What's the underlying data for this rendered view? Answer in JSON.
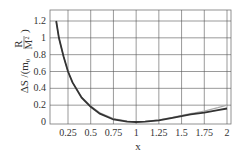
{
  "chart_data": {
    "type": "line",
    "title": "",
    "xlabel": "x",
    "ylabel": "ΔS /(m₀ R/M²)",
    "ylabel_parts": {
      "prefix": "ΔS /(m",
      "sub": "0",
      "frac_num": "R",
      "frac_den": "M",
      "sup": "2",
      "suffix": ")"
    },
    "xlim": [
      0.1,
      2.03
    ],
    "ylim": [
      -0.02,
      1.3
    ],
    "grid": true,
    "legend": null,
    "x_ticks": [
      0.25,
      0.5,
      0.75,
      1,
      1.25,
      1.5,
      1.75,
      2
    ],
    "x_tick_labels": [
      "0.25",
      "0.5",
      "0.75",
      "1",
      "1.25",
      "1.5",
      "1.75",
      "2"
    ],
    "y_ticks": [
      0,
      0.2,
      0.4,
      0.6,
      0.8,
      1,
      1.2
    ],
    "y_tick_labels": [
      "0",
      "0.2",
      "0.4",
      "0.6",
      "0.8",
      "1",
      "1.2"
    ],
    "x": [
      0.12,
      0.15,
      0.2,
      0.25,
      0.3,
      0.4,
      0.5,
      0.6,
      0.75,
      0.9,
      1.0,
      1.1,
      1.25,
      1.4,
      1.5,
      1.6,
      1.75,
      1.9,
      2.0
    ],
    "series": [
      {
        "name": "curve-dark",
        "color": "#333333",
        "values": [
          1.2,
          1.0,
          0.78,
          0.6,
          0.47,
          0.29,
          0.18,
          0.1,
          0.03,
          0.005,
          0.0,
          0.005,
          0.02,
          0.05,
          0.07,
          0.09,
          0.11,
          0.14,
          0.16
        ]
      },
      {
        "name": "curve-light",
        "color": "#aaaaaa",
        "values": [
          1.2,
          1.0,
          0.78,
          0.6,
          0.47,
          0.3,
          0.19,
          0.11,
          0.04,
          0.01,
          0.0,
          0.007,
          0.025,
          0.055,
          0.08,
          0.1,
          0.13,
          0.17,
          0.2
        ]
      }
    ]
  }
}
